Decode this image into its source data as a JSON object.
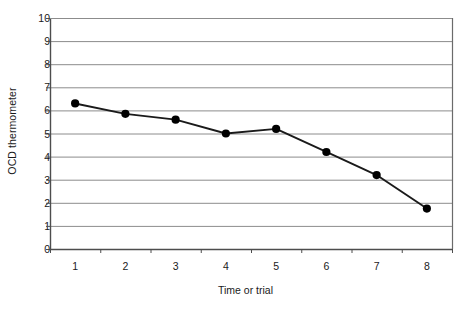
{
  "chart_data": {
    "type": "line",
    "title": "",
    "xlabel": "Time or trial",
    "ylabel": "OCD thermometer",
    "x": [
      1,
      2,
      3,
      4,
      5,
      6,
      7,
      8
    ],
    "values": [
      6.3,
      5.85,
      5.6,
      5.0,
      5.2,
      4.2,
      3.2,
      1.75
    ],
    "series": [
      {
        "name": "OCD thermometer",
        "values": [
          6.3,
          5.85,
          5.6,
          5.0,
          5.2,
          4.2,
          3.2,
          1.75
        ]
      }
    ],
    "xtick_labels": [
      "1",
      "2",
      "3",
      "4",
      "5",
      "6",
      "7",
      "8"
    ],
    "ytick_labels": [
      "0",
      "1",
      "2",
      "3",
      "4",
      "5",
      "6",
      "7",
      "8",
      "9",
      "10"
    ],
    "ylim": [
      0,
      10
    ],
    "xlim": [
      0.5,
      8.5
    ],
    "grid": "horizontal",
    "legend": "none",
    "marker": "filled-circle",
    "colors": {
      "line": "#1a1a1a",
      "marker": "#000000",
      "grid": "#8c8c8c",
      "axis": "#4d4d4d",
      "background": "#ffffff"
    }
  },
  "axes": {
    "y_title": "OCD thermometer",
    "x_title": "Time or trial"
  }
}
